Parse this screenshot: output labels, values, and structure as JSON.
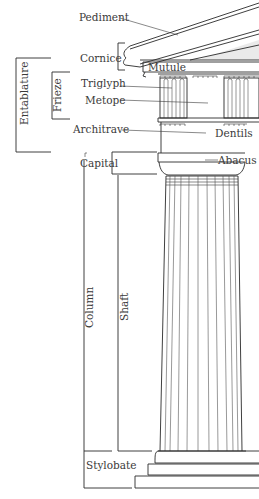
{
  "diagram": {
    "labels": {
      "pediment": "Pediment",
      "cornice": "Cornice",
      "mutule": "Mutule",
      "triglyph": "Triglyph",
      "metope": "Metope",
      "architrave": "Architrave",
      "dentils": "Dentils",
      "capital": "Capital",
      "abacus": "Abacus",
      "column": "Column",
      "shaft": "Shaft",
      "stylobate": "Stylobate",
      "entablature": "Entablature",
      "frieze": "Frieze"
    },
    "groups": [
      {
        "name": "Entablature",
        "includes": [
          "Cornice",
          "Frieze",
          "Architrave"
        ]
      },
      {
        "name": "Frieze",
        "includes": [
          "Triglyph",
          "Metope"
        ]
      },
      {
        "name": "Column",
        "includes": [
          "Capital",
          "Shaft"
        ]
      }
    ],
    "colors": {
      "line": "#2a2a2a",
      "text": "#3a3a3a",
      "background": "#ffffff",
      "shading": "#d6d6d6"
    }
  }
}
